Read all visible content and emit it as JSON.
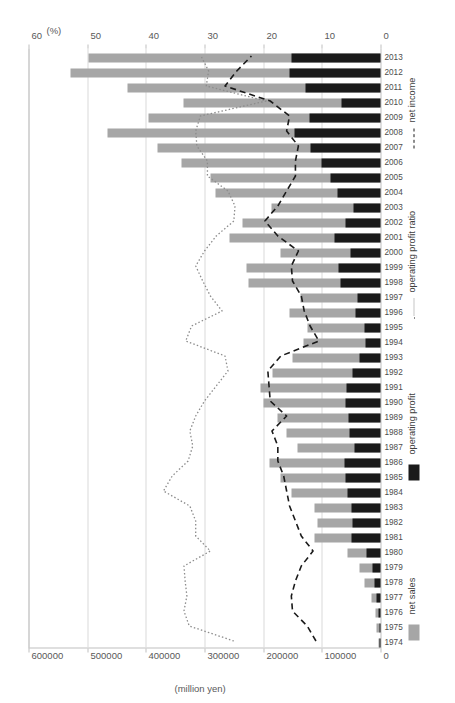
{
  "chart": {
    "primary_axis": {
      "title": "(million yen)",
      "ticks": [
        "0",
        "100000",
        "200000",
        "300000",
        "400000",
        "500000",
        "600000"
      ],
      "min": 0,
      "max": 600000
    },
    "secondary_axis": {
      "title": "(%)",
      "ticks": [
        "0",
        "10",
        "20",
        "30",
        "40",
        "50",
        "60"
      ],
      "min": 0,
      "max": 60
    },
    "legend": [
      {
        "key": "net-sales",
        "label": "net sales",
        "swatch": "bar",
        "color": "#a6a6a6"
      },
      {
        "key": "operating-profit",
        "label": "operating profit",
        "swatch": "bar",
        "color": "#1a1a1a"
      },
      {
        "key": "operating-profit-ratio",
        "label": "operating profit ratio",
        "swatch": "dotted-line",
        "color": "#8c8c8c"
      },
      {
        "key": "net-income",
        "label": "net income",
        "swatch": "dashed-line",
        "color": "#1a1a1a"
      }
    ]
  },
  "chart_data": {
    "type": "bar",
    "title": "",
    "xlabel": "",
    "ylabel": "(million yen)",
    "y2label": "(%)",
    "ylim": [
      0,
      600000
    ],
    "y2lim": [
      0,
      60
    ],
    "grid": true,
    "legend_position": "bottom",
    "orientation": "horizontal-rotated",
    "categories": [
      "1974",
      "1975",
      "1976",
      "1977",
      "1978",
      "1979",
      "1980",
      "1981",
      "1982",
      "1983",
      "1984",
      "1985",
      "1986",
      "1987",
      "1988",
      "1989",
      "1990",
      "1991",
      "1992",
      "1993",
      "1994",
      "1995",
      "1996",
      "1997",
      "1998",
      "1999",
      "2000",
      "2001",
      "2002",
      "2003",
      "2004",
      "2005",
      "2006",
      "2007",
      "2008",
      "2009",
      "2010",
      "2011",
      "2012",
      "2013"
    ],
    "series": [
      {
        "name": "net sales",
        "axis": "primary",
        "type": "bar",
        "color": "#a6a6a6",
        "units": "million yen",
        "values": [
          4000,
          6000,
          9000,
          16000,
          27000,
          35000,
          57000,
          112000,
          108000,
          112000,
          152000,
          170000,
          190000,
          141000,
          160000,
          175000,
          200000,
          205000,
          184000,
          150000,
          131000,
          124000,
          155000,
          137000,
          225000,
          228000,
          170000,
          258000,
          236000,
          185000,
          281000,
          289000,
          340000,
          380000,
          465000,
          395000,
          335000,
          432000,
          528000,
          497000
        ]
      },
      {
        "name": "operating profit",
        "axis": "primary",
        "type": "bar",
        "color": "#1a1a1a",
        "units": "million yen",
        "values": [
          1500,
          2000,
          3000,
          6000,
          11000,
          14000,
          24000,
          50000,
          48000,
          50000,
          57000,
          60000,
          62000,
          45000,
          52000,
          55000,
          60000,
          58000,
          48000,
          35000,
          26000,
          28000,
          42000,
          40000,
          68000,
          72000,
          51000,
          78000,
          59000,
          46000,
          73000,
          85000,
          100000,
          119000,
          146000,
          121000,
          66000,
          128000,
          155000,
          152000
        ]
      },
      {
        "name": "operating profit ratio",
        "axis": "secondary",
        "type": "line",
        "style": "dotted",
        "color": "#8c8c8c",
        "units": "%",
        "values": [
          25.0,
          32.6,
          33.5,
          33.0,
          33.3,
          33.5,
          29.0,
          31.5,
          31.5,
          32.5,
          37.0,
          35.5,
          32.8,
          32.0,
          32.5,
          31.5,
          30.0,
          28.0,
          26.0,
          26.5,
          33.2,
          32.2,
          27.0,
          29.0,
          30.3,
          31.5,
          30.0,
          28.0,
          25.0,
          24.8,
          26.0,
          29.5,
          29.5,
          31.3,
          31.5,
          30.7,
          19.5,
          29.7,
          29.3,
          30.6
        ]
      },
      {
        "name": "net income",
        "axis": "secondary",
        "type": "line",
        "style": "dashed",
        "color": "#1a1a1a",
        "units": "%",
        "values": [
          11.0,
          12.5,
          15.0,
          15.2,
          14.5,
          13.5,
          11.5,
          13.5,
          14.5,
          15.5,
          16.0,
          16.5,
          17.5,
          17.5,
          18.5,
          16.0,
          18.8,
          19.0,
          19.2,
          17.0,
          10.5,
          12.0,
          13.0,
          13.5,
          15.0,
          15.2,
          14.0,
          17.5,
          19.7,
          17.5,
          16.0,
          14.5,
          14.5,
          14.0,
          16.0,
          15.5,
          18.8,
          26.5,
          24.5,
          22.0
        ]
      }
    ]
  }
}
